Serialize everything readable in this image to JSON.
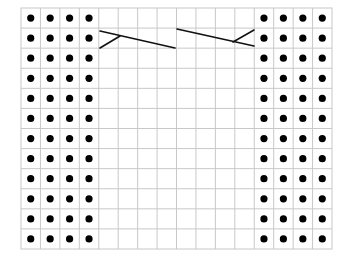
{
  "grid": {
    "columns": 16,
    "rows": 12,
    "left": 21,
    "top": 8,
    "right": 332,
    "bottom": 249,
    "line_color": "#c8c8c8",
    "background": "#ffffff"
  },
  "purl_dot": {
    "color": "#000000",
    "radius": 3.6,
    "columns": [
      0,
      1,
      2,
      3,
      12,
      13,
      14,
      15
    ],
    "rows": [
      0,
      1,
      2,
      3,
      4,
      5,
      6,
      7,
      8,
      9,
      10,
      11
    ]
  },
  "cables": [
    {
      "name": "left-cable-cross",
      "row": 1,
      "lines": [
        {
          "x1": 100,
          "y1": 31,
          "x2": 175,
          "y2": 48
        },
        {
          "x1": 100,
          "y1": 48,
          "x2": 120,
          "y2": 36
        }
      ]
    },
    {
      "name": "right-cable-cross",
      "row": 1,
      "lines": [
        {
          "x1": 177,
          "y1": 29,
          "x2": 254,
          "y2": 46
        },
        {
          "x1": 233,
          "y1": 42,
          "x2": 254,
          "y2": 30
        }
      ]
    }
  ],
  "stroke_color": "#111111"
}
